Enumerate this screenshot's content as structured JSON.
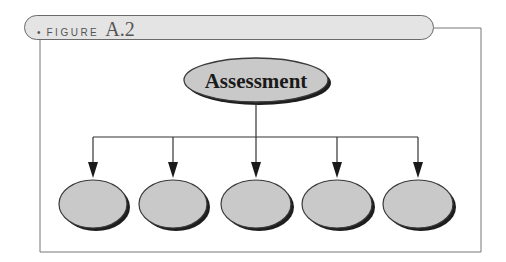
{
  "figure": {
    "bullet": "•",
    "label": "FIGURE",
    "number": "A.2"
  },
  "diagram": {
    "root": {
      "label": "Assessment"
    },
    "children": [
      {
        "label": ""
      },
      {
        "label": ""
      },
      {
        "label": ""
      },
      {
        "label": ""
      },
      {
        "label": ""
      }
    ],
    "colors": {
      "fill": "#c9c9c9",
      "stroke": "#3a3a3a",
      "shadow": "#1e1e1e",
      "text": "#1a1a1a"
    }
  }
}
